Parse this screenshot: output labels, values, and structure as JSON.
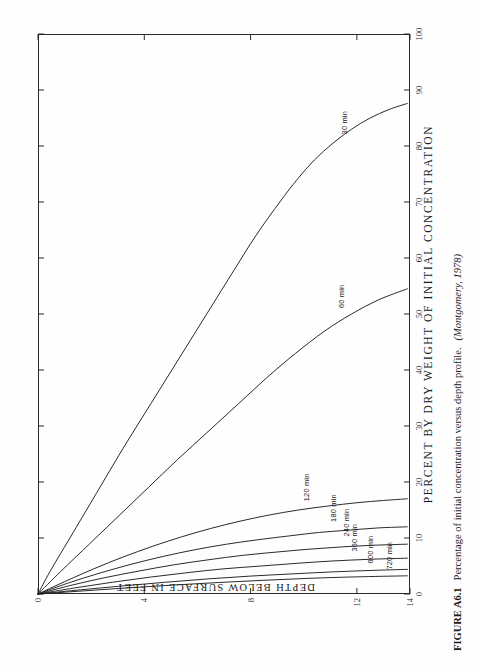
{
  "figure": {
    "caption_label": "FIGURE A6.1",
    "caption_text": "Percentage of initial concentration versus depth profile.",
    "caption_source": "(Montgomery, 1978)"
  },
  "chart_data": {
    "type": "line",
    "title": "",
    "xlabel": "PERCENT BY DRY WEIGHT OF INITIAL CONCENTRATION",
    "ylabel": "DEPTH BELOW SURFACE IN FEET",
    "xlim": [
      0,
      100
    ],
    "ylim": [
      0,
      14
    ],
    "xticks": [
      0,
      10,
      20,
      30,
      40,
      50,
      60,
      70,
      80,
      90,
      100
    ],
    "xtick_labels": [
      "0",
      "10",
      "20",
      "30",
      "40",
      "50",
      "60",
      "70",
      "80",
      "90",
      "100"
    ],
    "yticks": [
      0,
      4,
      8,
      12,
      14
    ],
    "ytick_labels": [
      "0",
      "4",
      "8",
      "12",
      "14"
    ],
    "grid": false,
    "legend": "inline-labels",
    "series": [
      {
        "name": "30 min",
        "label": "30 min",
        "label_x": 81,
        "label_y": 11.5,
        "points": [
          [
            0,
            0
          ],
          [
            4,
            0.45
          ],
          [
            10,
            1.2
          ],
          [
            18,
            2.2
          ],
          [
            26,
            3.2
          ],
          [
            34,
            4.25
          ],
          [
            42,
            5.3
          ],
          [
            50,
            6.35
          ],
          [
            58,
            7.4
          ],
          [
            64,
            8.2
          ],
          [
            70,
            9.1
          ],
          [
            74,
            9.75
          ],
          [
            77.5,
            10.4
          ],
          [
            80.5,
            11.1
          ],
          [
            83,
            11.8
          ],
          [
            85,
            12.5
          ],
          [
            86.5,
            13.2
          ],
          [
            87.6,
            13.9
          ]
        ]
      },
      {
        "name": "60 min",
        "label": "60 min",
        "label_x": 50,
        "label_y": 11.4,
        "points": [
          [
            0,
            0
          ],
          [
            4,
            0.85
          ],
          [
            9,
            1.95
          ],
          [
            14,
            3.05
          ],
          [
            19,
            4.15
          ],
          [
            24,
            5.25
          ],
          [
            29,
            6.4
          ],
          [
            34,
            7.55
          ],
          [
            39,
            8.7
          ],
          [
            43,
            9.7
          ],
          [
            47,
            10.8
          ],
          [
            50,
            11.8
          ],
          [
            52.5,
            12.8
          ],
          [
            54.5,
            13.9
          ]
        ]
      },
      {
        "name": "120 min",
        "label": "120 min",
        "label_x": 15.5,
        "label_y": 10.1,
        "points": [
          [
            0,
            0
          ],
          [
            2.2,
            1.0
          ],
          [
            4.5,
            2.1
          ],
          [
            6.6,
            3.2
          ],
          [
            8.5,
            4.3
          ],
          [
            10.2,
            5.4
          ],
          [
            11.7,
            6.5
          ],
          [
            13.0,
            7.6
          ],
          [
            14.1,
            8.7
          ],
          [
            15.0,
            9.8
          ],
          [
            15.7,
            10.9
          ],
          [
            16.3,
            12.0
          ],
          [
            16.7,
            13.0
          ],
          [
            17.0,
            13.9
          ]
        ]
      },
      {
        "name": "180 min",
        "label": "180 min",
        "label_x": 11.8,
        "label_y": 11.1,
        "points": [
          [
            0,
            0
          ],
          [
            1.9,
            1.1
          ],
          [
            3.7,
            2.3
          ],
          [
            5.3,
            3.5
          ],
          [
            6.7,
            4.7
          ],
          [
            7.9,
            5.9
          ],
          [
            8.9,
            7.1
          ],
          [
            9.7,
            8.3
          ],
          [
            10.4,
            9.5
          ],
          [
            11.0,
            10.6
          ],
          [
            11.4,
            11.7
          ],
          [
            11.8,
            12.8
          ],
          [
            12.0,
            13.9
          ]
        ]
      },
      {
        "name": "240 min",
        "label": "240 min",
        "label_x": 9.2,
        "label_y": 11.6,
        "points": [
          [
            0,
            0
          ],
          [
            1.5,
            1.2
          ],
          [
            2.9,
            2.5
          ],
          [
            4.1,
            3.8
          ],
          [
            5.2,
            5.1
          ],
          [
            6.1,
            6.4
          ],
          [
            6.9,
            7.7
          ],
          [
            7.5,
            9.0
          ],
          [
            8.0,
            10.2
          ],
          [
            8.4,
            11.4
          ],
          [
            8.7,
            12.6
          ],
          [
            8.9,
            13.9
          ]
        ]
      },
      {
        "name": "360 min",
        "label": "360 min",
        "label_x": 6.5,
        "label_y": 11.9,
        "points": [
          [
            0,
            0
          ],
          [
            1.1,
            1.4
          ],
          [
            2.1,
            2.8
          ],
          [
            3.0,
            4.2
          ],
          [
            3.8,
            5.6
          ],
          [
            4.5,
            7.0
          ],
          [
            5.0,
            8.4
          ],
          [
            5.5,
            9.8
          ],
          [
            5.9,
            11.1
          ],
          [
            6.2,
            12.5
          ],
          [
            6.4,
            13.9
          ]
        ]
      },
      {
        "name": "600 min",
        "label": "600 min",
        "label_x": 4.4,
        "label_y": 12.5,
        "points": [
          [
            0,
            0
          ],
          [
            0.75,
            1.6
          ],
          [
            1.45,
            3.2
          ],
          [
            2.1,
            4.8
          ],
          [
            2.7,
            6.4
          ],
          [
            3.2,
            8.0
          ],
          [
            3.6,
            9.6
          ],
          [
            3.95,
            11.1
          ],
          [
            4.2,
            12.5
          ],
          [
            4.4,
            13.9
          ]
        ]
      },
      {
        "name": "720 min",
        "label": "720 min",
        "label_x": 3.3,
        "label_y": 13.2,
        "points": [
          [
            0,
            0
          ],
          [
            0.55,
            1.7
          ],
          [
            1.1,
            3.4
          ],
          [
            1.6,
            5.1
          ],
          [
            2.05,
            6.8
          ],
          [
            2.45,
            8.5
          ],
          [
            2.8,
            10.2
          ],
          [
            3.05,
            11.9
          ],
          [
            3.25,
            13.9
          ]
        ]
      }
    ]
  }
}
